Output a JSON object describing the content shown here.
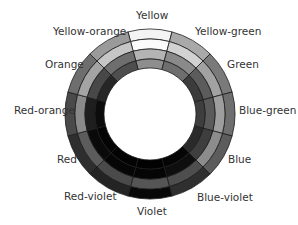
{
  "diagram": {
    "center": [
      150,
      114
    ],
    "radii": [
      85,
      75,
      65,
      55,
      46
    ],
    "start_angle_deg": -105,
    "stroke_color": "#1a1a1a",
    "sectors": [
      {
        "name": "Yellow",
        "shades": [
          "#f4f4f4",
          "#fbfbfb",
          "#b4b4b4",
          "#8e8e8e"
        ],
        "label_pos": [
          136,
          10
        ]
      },
      {
        "name": "Yellow-green",
        "shades": [
          "#a9a9a9",
          "#d2d2d2",
          "#8a8a8a",
          "#6e6e6e"
        ],
        "label_pos": [
          195,
          26
        ]
      },
      {
        "name": "Green",
        "shades": [
          "#7a7a7a",
          "#a2a2a2",
          "#5c5c5c",
          "#3c3c3c"
        ],
        "label_pos": [
          227,
          59
        ]
      },
      {
        "name": "Blue-green",
        "shades": [
          "#6e6e6e",
          "#9e9e9e",
          "#5a5a5a",
          "#3e3e3e"
        ],
        "label_pos": [
          239,
          105
        ]
      },
      {
        "name": "Blue",
        "shades": [
          "#5c5c5c",
          "#8c8c8c",
          "#3e3e3e",
          "#2a2a2a"
        ],
        "label_pos": [
          228,
          154
        ]
      },
      {
        "name": "Blue-violet",
        "shades": [
          "#2f2f2f",
          "#4e4e4e",
          "#0e0e0e",
          "#050505"
        ],
        "label_pos": [
          197,
          192
        ]
      },
      {
        "name": "Violet",
        "shades": [
          "#080808",
          "#555555",
          "#050505",
          "#020202"
        ],
        "label_pos": [
          137,
          206
        ]
      },
      {
        "name": "Red-violet",
        "shades": [
          "#242424",
          "#4a4a4a",
          "#060606",
          "#030303"
        ],
        "label_pos": [
          64,
          191
        ]
      },
      {
        "name": "Red",
        "shades": [
          "#2e2e2e",
          "#5c5c5c",
          "#0a0a0a",
          "#040404"
        ],
        "label_pos": [
          57,
          154
        ]
      },
      {
        "name": "Red-orange",
        "shades": [
          "#4a4a4a",
          "#8a8a8a",
          "#1e1e1e",
          "#0c0c0c"
        ],
        "label_pos": [
          14,
          105
        ]
      },
      {
        "name": "Orange",
        "shades": [
          "#6e6e6e",
          "#a4a4a4",
          "#484848",
          "#262626"
        ],
        "label_pos": [
          45,
          59
        ]
      },
      {
        "name": "Yellow-orange",
        "shades": [
          "#9a9a9a",
          "#c6c6c6",
          "#6e6e6e",
          "#4e4e4e"
        ],
        "label_pos": [
          53,
          26
        ]
      }
    ]
  }
}
